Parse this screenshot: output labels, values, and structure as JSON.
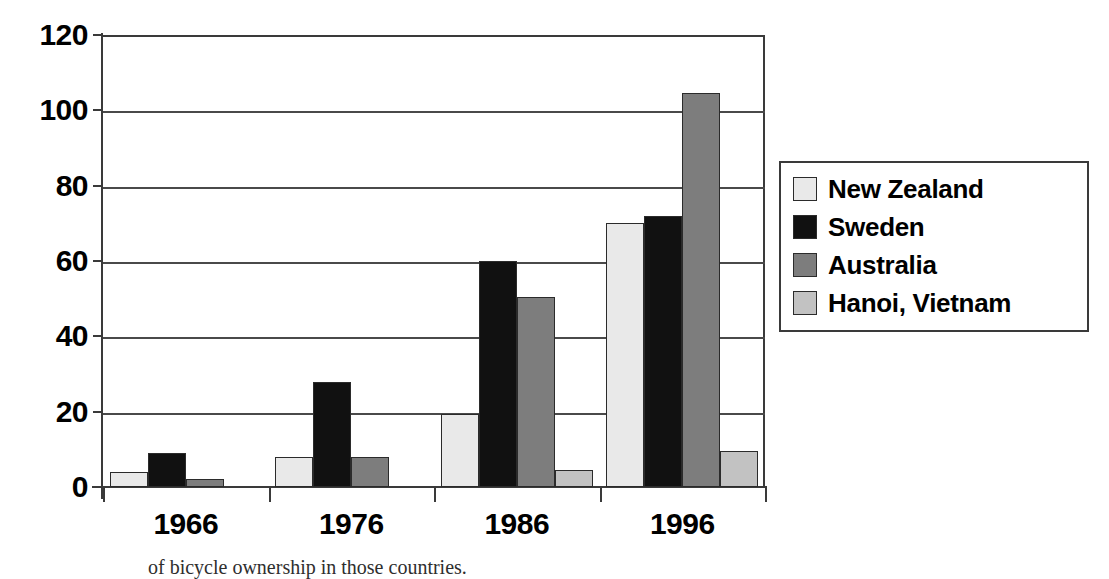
{
  "chart_data": {
    "type": "bar",
    "title": "",
    "subtitle": "",
    "xlabel": "",
    "ylabel": "",
    "categories": [
      "1966",
      "1976",
      "1986",
      "1996"
    ],
    "ylim": [
      0,
      120
    ],
    "yticks": [
      0,
      20,
      40,
      60,
      80,
      100,
      120
    ],
    "ytick_labels": [
      "0",
      "20",
      "40",
      "60",
      "80",
      "100",
      "120"
    ],
    "grid": "horizontal",
    "legend_position": "right",
    "series": [
      {
        "name": "New Zealand",
        "color": "#e9e9e9",
        "values": [
          4,
          8,
          19.5,
          70
        ]
      },
      {
        "name": "Sweden",
        "color": "#111111",
        "values": [
          9,
          28,
          60,
          72
        ]
      },
      {
        "name": "Australia",
        "color": "#7d7d7d",
        "values": [
          2,
          8,
          50.5,
          104.5
        ]
      },
      {
        "name": "Hanoi, Vietnam",
        "color": "#c2c2c2",
        "values": [
          0,
          0,
          4.5,
          9.5
        ]
      }
    ]
  },
  "legend": {
    "items": [
      {
        "label": "New Zealand",
        "color": "#e9e9e9"
      },
      {
        "label": "Sweden",
        "color": "#111111"
      },
      {
        "label": "Australia",
        "color": "#7d7d7d"
      },
      {
        "label": "Hanoi, Vietnam",
        "color": "#c2c2c2"
      }
    ]
  },
  "caption": {
    "text": "of bicycle ownership in those countries."
  },
  "colors": {
    "axis": "#3a3a3a",
    "gridline": "#4a4a4a",
    "bar_outline": "#2b2b2b",
    "text": "#000000",
    "background": "#ffffff"
  }
}
